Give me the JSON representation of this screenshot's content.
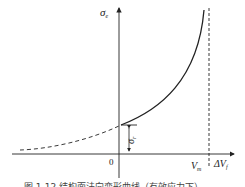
{
  "diagram": {
    "y_axis_label": "σ",
    "y_axis_label_sub": "e",
    "x_axis_label": "ΔV",
    "x_axis_label_sub": "f",
    "origin_label": "0",
    "asymptote_label": "V",
    "asymptote_label_sub": "m",
    "intercept_label": "σ",
    "intercept_label_sub": "r",
    "caption": "图 1-12   结构面法向变形曲线（有效应力下）",
    "colors": {
      "line": "#222222",
      "background": "#ffffff"
    },
    "curve": {
      "solid_segment": "from intercept σr on y-axis rising asymptotically toward Vm",
      "dashed_segment": "extension into negative ΔVf region, approaching x-axis"
    }
  }
}
